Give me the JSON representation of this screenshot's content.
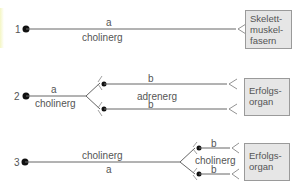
{
  "diagram": {
    "rows": [
      {
        "number": "1",
        "labels": {
          "top": "a",
          "bottom": "cholinerg"
        },
        "target": "Skelett-\nmuskel-\nfasern",
        "target_lines": [
          "Skelett-",
          "muskel-",
          "fasern"
        ]
      },
      {
        "number": "2",
        "labels": {
          "pre_top": "a",
          "pre_bottom": "cholinerg",
          "post_upper": "b",
          "post_middle": "adrenerg",
          "post_lower": "b"
        },
        "target_lines": [
          "Erfolgs-",
          "organ"
        ]
      },
      {
        "number": "3",
        "labels": {
          "pre_top": "cholinerg",
          "pre_bottom": "a",
          "post_upper": "b",
          "post_middle": "cholinerg",
          "post_lower": "b"
        },
        "target_lines": [
          "Erfolgs-",
          "organ"
        ]
      }
    ],
    "colors": {
      "line": "#555555",
      "dot": "#111111",
      "box_fill": "#e6e6e6",
      "box_border": "#9a9a9a",
      "text": "#555555"
    }
  }
}
